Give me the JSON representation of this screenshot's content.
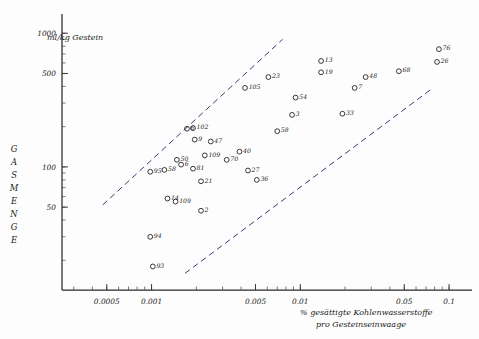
{
  "figure": {
    "unit_label": "ml/kg Gestein",
    "y_axis_title": "G A S M E N G E",
    "x_axis_title_line1": "% gesättigte Kohlenwasserstoffe",
    "x_axis_title_line2": "pro Gesteinseinwaage"
  },
  "chart_data": {
    "type": "scatter",
    "title": "",
    "subtitle": "",
    "xlabel": "% gesättigte Kohlenwasserstoffe pro Gesteinseinwaage",
    "ylabel": "GASMENGE (ml/kg Gestein)",
    "xscale": "log",
    "yscale": "log",
    "xlim": [
      0.00025,
      0.13
    ],
    "ylim": [
      12,
      1300
    ],
    "grid": false,
    "legend": "none",
    "x_ticks": [
      0.0005,
      0.001,
      0.005,
      0.01,
      0.05,
      0.1
    ],
    "x_tick_labels": [
      "0.0005",
      "0.001",
      "0.005",
      "0.01",
      "0.05",
      "0.1"
    ],
    "y_ticks": [
      50,
      100,
      500,
      1000
    ],
    "y_tick_labels": [
      "50",
      "100",
      "500",
      "1000"
    ],
    "marker": "open-circle",
    "point_label_field": "label",
    "points": [
      {
        "label": "76",
        "x": 0.0855,
        "y": 760
      },
      {
        "label": "26",
        "x": 0.083,
        "y": 610
      },
      {
        "label": "68",
        "x": 0.046,
        "y": 520
      },
      {
        "label": "48",
        "x": 0.0275,
        "y": 470
      },
      {
        "label": "7",
        "x": 0.0232,
        "y": 390
      },
      {
        "label": "13",
        "x": 0.0138,
        "y": 620
      },
      {
        "label": "19",
        "x": 0.0138,
        "y": 510
      },
      {
        "label": "33",
        "x": 0.0192,
        "y": 250
      },
      {
        "label": "23",
        "x": 0.0061,
        "y": 470
      },
      {
        "label": "105",
        "x": 0.00425,
        "y": 390
      },
      {
        "label": "54",
        "x": 0.0093,
        "y": 330
      },
      {
        "label": "3",
        "x": 0.0088,
        "y": 245
      },
      {
        "label": "58",
        "x": 0.007,
        "y": 185
      },
      {
        "label": "6",
        "x": 0.00173,
        "y": 193
      },
      {
        "label": "102",
        "x": 0.0019,
        "y": 195
      },
      {
        "label": "9",
        "x": 0.00195,
        "y": 160
      },
      {
        "label": "47",
        "x": 0.0025,
        "y": 155
      },
      {
        "label": "40",
        "x": 0.0039,
        "y": 130
      },
      {
        "label": "109",
        "x": 0.00228,
        "y": 122
      },
      {
        "label": "70",
        "x": 0.0032,
        "y": 113
      },
      {
        "label": "50",
        "x": 0.00148,
        "y": 113
      },
      {
        "label": "6b",
        "x": 0.00158,
        "y": 104
      },
      {
        "label": "81",
        "x": 0.0019,
        "y": 97
      },
      {
        "label": "58b",
        "x": 0.00122,
        "y": 95
      },
      {
        "label": "95",
        "x": 0.00098,
        "y": 92
      },
      {
        "label": "27",
        "x": 0.00445,
        "y": 94
      },
      {
        "label": "36",
        "x": 0.0051,
        "y": 80
      },
      {
        "label": "21",
        "x": 0.00215,
        "y": 78
      },
      {
        "label": "14",
        "x": 0.00128,
        "y": 58
      },
      {
        "label": "109b",
        "x": 0.00145,
        "y": 55
      },
      {
        "label": "2",
        "x": 0.00215,
        "y": 47
      },
      {
        "label": "94",
        "x": 0.00098,
        "y": 30
      },
      {
        "label": "93",
        "x": 0.00102,
        "y": 18
      }
    ],
    "trend_lines": [
      {
        "name": "upper-envelope",
        "x0": 0.00047,
        "y0": 52,
        "x1": 0.0076,
        "y1": 900
      },
      {
        "name": "lower-envelope",
        "x0": 0.00168,
        "y0": 16,
        "x1": 0.078,
        "y1": 390
      }
    ]
  }
}
